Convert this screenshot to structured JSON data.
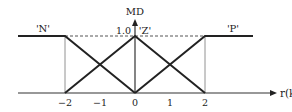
{
  "diagram": {
    "type": "fuzzy-membership-functions",
    "y_axis_label": "MD",
    "x_axis_label": "r(k)",
    "peak_label": "1.0",
    "sets": [
      {
        "name": "'N'",
        "shape": "left-shoulder",
        "points": [
          [
            -2,
            1
          ],
          [
            0,
            0
          ]
        ]
      },
      {
        "name": "'Z'",
        "shape": "triangle",
        "points": [
          [
            -2,
            0
          ],
          [
            0,
            1
          ],
          [
            2,
            0
          ]
        ]
      },
      {
        "name": "'P'",
        "shape": "right-shoulder",
        "points": [
          [
            0,
            0
          ],
          [
            2,
            1
          ]
        ]
      }
    ],
    "x_ticks": [
      "−2",
      "−1",
      "0",
      "1",
      "2"
    ]
  }
}
